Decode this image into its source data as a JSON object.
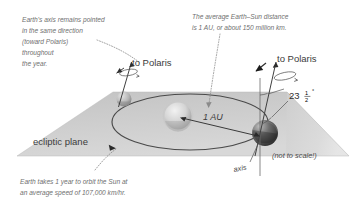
{
  "figure": {
    "background_color": "#ffffff",
    "plane_color": "#c9c9c9",
    "caption_color": "#6f6f6f",
    "line_color": "#3f3f3f"
  },
  "captions": {
    "axis_pointing": {
      "lines": [
        "Earth's axis remains pointed",
        "in the same direction",
        "(toward Polaris)",
        "throughout",
        "the year."
      ]
    },
    "au_distance": {
      "lines": [
        "The average Earth–Sun distance",
        "is 1 AU, or about 150 million km."
      ]
    },
    "orbit_speed": {
      "lines": [
        "Earth takes 1 year to orbit the Sun at",
        "an average speed of 107,000 km/hr."
      ]
    }
  },
  "labels": {
    "to_polaris_left": "to Polaris",
    "to_polaris_right": "to Polaris",
    "ecliptic_plane": "ecliptic plane",
    "one_au": "1 AU",
    "axis": "axis",
    "not_to_scale": "(not to scale!)",
    "tilt_whole": "23",
    "tilt_num": "1",
    "tilt_den": "2",
    "tilt_degree": "°",
    "tilt_full": "23 1/2°"
  },
  "diagram_data": {
    "type": "schematic",
    "sun": {
      "cx": 178,
      "cy": 116,
      "r": 14,
      "name": "Sun"
    },
    "earth_left": {
      "cx": 124,
      "cy": 99,
      "r": 7.5,
      "name": "Earth (far position)"
    },
    "earth_right": {
      "cx": 265,
      "cy": 133,
      "r": 13,
      "name": "Earth (near position)"
    },
    "axial_tilt_degrees": 23.5,
    "earth_sun_distance_au": 1,
    "earth_sun_distance_km": "150 million km",
    "orbital_period": "1 year",
    "orbital_speed": "107,000 km/hr",
    "axis_direction": "toward Polaris",
    "scale_note": "not to scale"
  }
}
